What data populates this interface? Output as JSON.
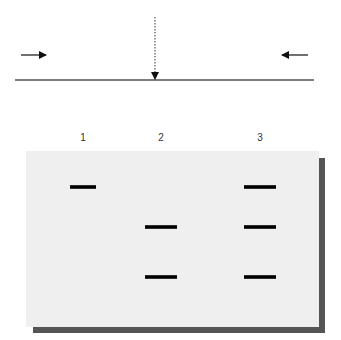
{
  "figure": {
    "type": "schematic",
    "top_panel": {
      "description": "Horizontal line with converging arrows from left and right and a dotted vertical arrow pointing down to the line center",
      "arrows": [
        {
          "id": "left",
          "direction": "right",
          "style": "solid"
        },
        {
          "id": "right",
          "direction": "left",
          "style": "solid"
        },
        {
          "id": "center",
          "direction": "down",
          "style": "dotted"
        }
      ]
    },
    "gel": {
      "background_color": "#efefef",
      "shadow_color": "#555555",
      "band_color": "#000000",
      "lanes": [
        {
          "label": "1",
          "bands": [
            "top"
          ]
        },
        {
          "label": "2",
          "bands": [
            "middle",
            "bottom"
          ]
        },
        {
          "label": "3",
          "bands": [
            "top",
            "middle",
            "bottom"
          ]
        }
      ]
    }
  }
}
